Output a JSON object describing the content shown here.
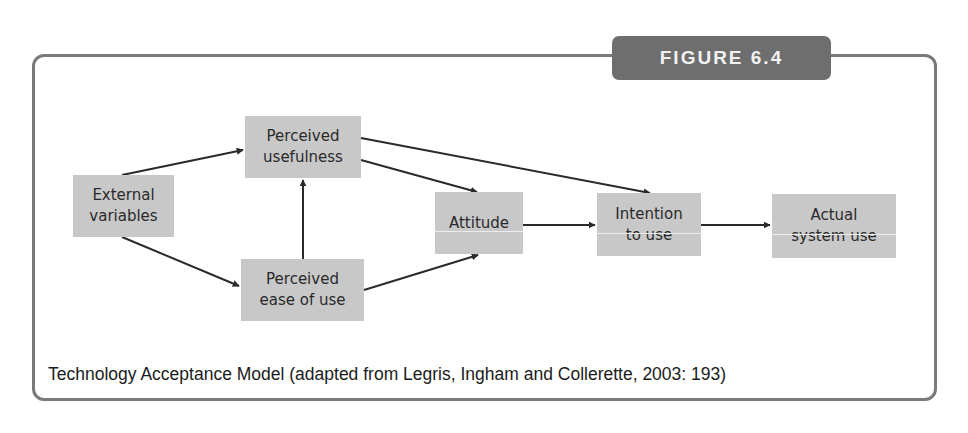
{
  "figure": {
    "badge": "FIGURE 6.4",
    "caption": "Technology Acceptance Model (adapted from Legris, Ingham and Collerette, 2003: 193)"
  },
  "nodes": {
    "external": "External\nvariables",
    "usefulness": "Perceived\nusefulness",
    "ease": "Perceived\nease of use",
    "attitude": "Attitude",
    "intention": "Intention\nto use",
    "actual": "Actual\nsystem use"
  },
  "edges": [
    {
      "from": "external",
      "to": "usefulness"
    },
    {
      "from": "external",
      "to": "ease"
    },
    {
      "from": "ease",
      "to": "usefulness"
    },
    {
      "from": "usefulness",
      "to": "attitude"
    },
    {
      "from": "usefulness",
      "to": "intention"
    },
    {
      "from": "ease",
      "to": "attitude"
    },
    {
      "from": "attitude",
      "to": "intention"
    },
    {
      "from": "intention",
      "to": "actual"
    }
  ],
  "colors": {
    "node_fill": "#c8c8c8",
    "badge_fill": "#6e6e6e",
    "frame": "#7a7a7a",
    "arrow": "#2a2a2a"
  }
}
